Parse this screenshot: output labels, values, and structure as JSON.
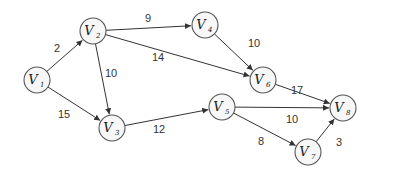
{
  "graph": {
    "nodes": [
      {
        "id": "V1",
        "label": "V",
        "sub": "1",
        "x": 37,
        "y": 80
      },
      {
        "id": "V2",
        "label": "V",
        "sub": "2",
        "x": 93,
        "y": 31
      },
      {
        "id": "V3",
        "label": "V",
        "sub": "3",
        "x": 112,
        "y": 128
      },
      {
        "id": "V4",
        "label": "V",
        "sub": "4",
        "x": 205,
        "y": 25
      },
      {
        "id": "V5",
        "label": "V",
        "sub": "5",
        "x": 222,
        "y": 107
      },
      {
        "id": "V6",
        "label": "V",
        "sub": "6",
        "x": 263,
        "y": 80
      },
      {
        "id": "V7",
        "label": "V",
        "sub": "7",
        "x": 308,
        "y": 152
      },
      {
        "id": "V8",
        "label": "V",
        "sub": "8",
        "x": 343,
        "y": 108
      }
    ],
    "edges": [
      {
        "from": "V1",
        "to": "V2",
        "weight": "2",
        "lx": 57,
        "ly": 52
      },
      {
        "from": "V1",
        "to": "V3",
        "weight": "15",
        "lx": 64,
        "ly": 118
      },
      {
        "from": "V2",
        "to": "V4",
        "weight": "9",
        "lx": 148,
        "ly": 22
      },
      {
        "from": "V2",
        "to": "V6",
        "weight": "14",
        "lx": 158,
        "ly": 61
      },
      {
        "from": "V2",
        "to": "V3",
        "weight": "10",
        "lx": 111,
        "ly": 77
      },
      {
        "from": "V4",
        "to": "V6",
        "weight": "10",
        "lx": 254,
        "ly": 47
      },
      {
        "from": "V3",
        "to": "V5",
        "weight": "12",
        "lx": 159,
        "ly": 133
      },
      {
        "from": "V6",
        "to": "V8",
        "weight": "17",
        "lx": 297,
        "ly": 94
      },
      {
        "from": "V5",
        "to": "V8",
        "weight": "10",
        "lx": 292,
        "ly": 123
      },
      {
        "from": "V5",
        "to": "V7",
        "weight": "8",
        "lx": 261,
        "ly": 145
      },
      {
        "from": "V7",
        "to": "V8",
        "weight": "3",
        "lx": 339,
        "ly": 146
      }
    ],
    "radius": 13
  }
}
